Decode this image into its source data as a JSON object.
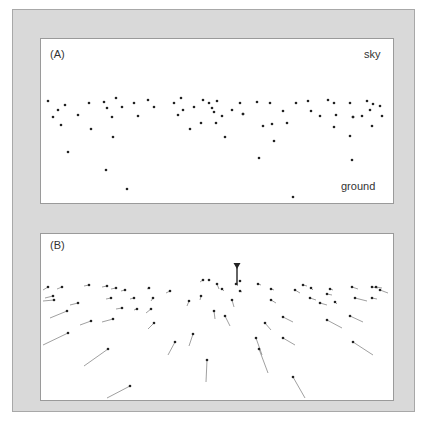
{
  "panels": [
    {
      "id": "A",
      "label": "(A)",
      "annotations": {
        "top": "sky",
        "bottom": "ground"
      },
      "description": "Scatter of sampled points in an image plane, dense near horizon, sparse toward ground",
      "points": [
        [
          48,
          101
        ],
        [
          53,
          117
        ],
        [
          58,
          110
        ],
        [
          61,
          125
        ],
        [
          65,
          105
        ],
        [
          68,
          152
        ],
        [
          78,
          115
        ],
        [
          89,
          103
        ],
        [
          91,
          129
        ],
        [
          104,
          102
        ],
        [
          106,
          170
        ],
        [
          107,
          108
        ],
        [
          112,
          117
        ],
        [
          113,
          137
        ],
        [
          116,
          98
        ],
        [
          122,
          107
        ],
        [
          127,
          189
        ],
        [
          134,
          103
        ],
        [
          138,
          116
        ],
        [
          148,
          100
        ],
        [
          154,
          107
        ],
        [
          174,
          103
        ],
        [
          178,
          115
        ],
        [
          181,
          98
        ],
        [
          183,
          110
        ],
        [
          190,
          129
        ],
        [
          194,
          107
        ],
        [
          201,
          123
        ],
        [
          203,
          100
        ],
        [
          209,
          103
        ],
        [
          212,
          108
        ],
        [
          217,
          101
        ],
        [
          214,
          112
        ],
        [
          216,
          123
        ],
        [
          222,
          116
        ],
        [
          225,
          137
        ],
        [
          232,
          110
        ],
        [
          240,
          103
        ],
        [
          243,
          114
        ],
        [
          243,
          114
        ],
        [
          257,
          102
        ],
        [
          259,
          158
        ],
        [
          263,
          126
        ],
        [
          270,
          103
        ],
        [
          272,
          124
        ],
        [
          274,
          141
        ],
        [
          283,
          111
        ],
        [
          287,
          123
        ],
        [
          293,
          197
        ],
        [
          296,
          103
        ],
        [
          308,
          101
        ],
        [
          311,
          111
        ],
        [
          320,
          116
        ],
        [
          328,
          100
        ],
        [
          334,
          103
        ],
        [
          336,
          115
        ],
        [
          334,
          127
        ],
        [
          350,
          103
        ],
        [
          350,
          136
        ],
        [
          353,
          117
        ],
        [
          353,
          117
        ],
        [
          352,
          160
        ],
        [
          362,
          116
        ],
        [
          367,
          101
        ],
        [
          370,
          110
        ],
        [
          372,
          126
        ],
        [
          373,
          104
        ],
        [
          380,
          106
        ],
        [
          382,
          116
        ]
      ]
    },
    {
      "id": "B",
      "label": "(B)",
      "description": "Same points with motion vectors; marker denotes focus of expansion",
      "marker": {
        "x": 237,
        "y": 285,
        "stem_top": 264
      },
      "vectors": [
        [
          48,
          287,
          43,
          290
        ],
        [
          53,
          296,
          45,
          298
        ],
        [
          54,
          300,
          43,
          301
        ],
        [
          62,
          287,
          57,
          289
        ],
        [
          67,
          311,
          50,
          318
        ],
        [
          68,
          333,
          43,
          345
        ],
        [
          78,
          303,
          70,
          305
        ],
        [
          89,
          285,
          84,
          286
        ],
        [
          91,
          321,
          80,
          325
        ],
        [
          107,
          286,
          102,
          287
        ],
        [
          108,
          349,
          84,
          366
        ],
        [
          111,
          298,
          106,
          299
        ],
        [
          113,
          319,
          102,
          322
        ],
        [
          116,
          288,
          111,
          289
        ],
        [
          122,
          308,
          116,
          309
        ],
        [
          125,
          290,
          121,
          291
        ],
        [
          130,
          386,
          107,
          398
        ],
        [
          134,
          298,
          130,
          299
        ],
        [
          137,
          309,
          134,
          310
        ],
        [
          149,
          288,
          147,
          289
        ],
        [
          153,
          298,
          151,
          301
        ],
        [
          151,
          309,
          146,
          313
        ],
        [
          154,
          323,
          148,
          329
        ],
        [
          170,
          291,
          166,
          293
        ],
        [
          175,
          342,
          168,
          355
        ],
        [
          189,
          301,
          187,
          306
        ],
        [
          193,
          334,
          189,
          346
        ],
        [
          201,
          296,
          200,
          300
        ],
        [
          203,
          280,
          200,
          282
        ],
        [
          207,
          360,
          206,
          382
        ],
        [
          209,
          280
        ],
        [
          217,
          284,
          219,
          289
        ],
        [
          214,
          311,
          215,
          319
        ],
        [
          222,
          289,
          224,
          291
        ],
        [
          225,
          316,
          230,
          326
        ],
        [
          232,
          300,
          234,
          307
        ],
        [
          236,
          284,
          238,
          286
        ],
        [
          240,
          281
        ],
        [
          240,
          291,
          242,
          292
        ],
        [
          256,
          338,
          262,
          355
        ],
        [
          259,
          349,
          268,
          373
        ],
        [
          258,
          284,
          261,
          285
        ],
        [
          265,
          323,
          271,
          330
        ],
        [
          271,
          289,
          274,
          290
        ],
        [
          271,
          300,
          276,
          303
        ],
        [
          283,
          317,
          293,
          322
        ],
        [
          283,
          338,
          295,
          345
        ],
        [
          293,
          377,
          305,
          398
        ],
        [
          295,
          290,
          300,
          293
        ],
        [
          303,
          285,
          307,
          286
        ],
        [
          310,
          298,
          316,
          300
        ],
        [
          311,
          288,
          313,
          290
        ],
        [
          320,
          303,
          327,
          305
        ],
        [
          327,
          320,
          342,
          328
        ],
        [
          330,
          289,
          333,
          290
        ],
        [
          327,
          294,
          332,
          295
        ],
        [
          335,
          302,
          337,
          304
        ],
        [
          350,
          316,
          363,
          322
        ],
        [
          353,
          342,
          373,
          355
        ],
        [
          355,
          298,
          367,
          301
        ],
        [
          352,
          287,
          358,
          289
        ],
        [
          372,
          287,
          378,
          288
        ],
        [
          372,
          298,
          377,
          299
        ],
        [
          376,
          287,
          382,
          288
        ],
        [
          380,
          290,
          388,
          293
        ]
      ]
    }
  ],
  "colors": {
    "frame": "#d9d9d9",
    "panel": "#ffffff",
    "dot": "#222222",
    "line": "#888888",
    "text": "#333333"
  }
}
